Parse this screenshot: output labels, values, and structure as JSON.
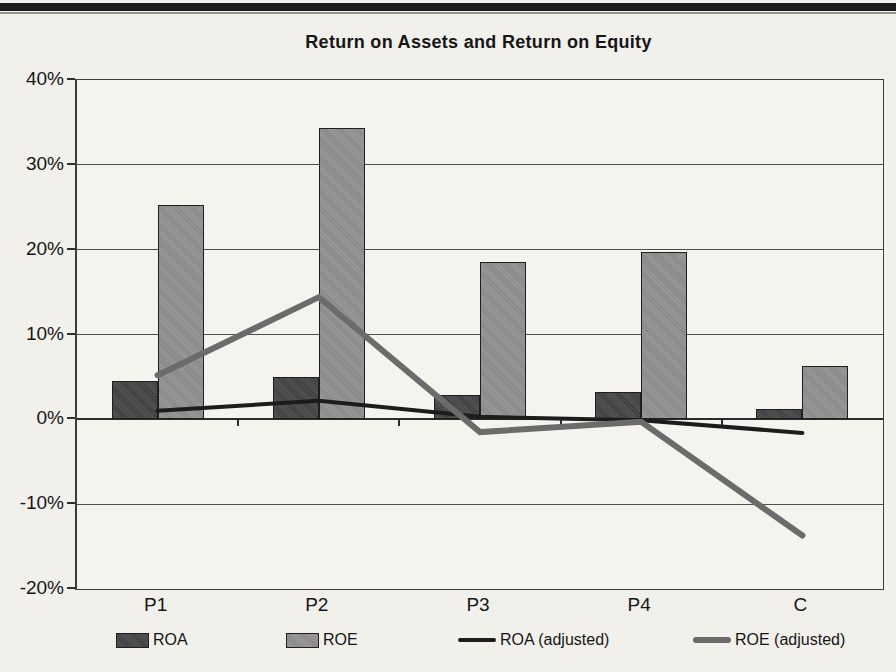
{
  "chart_data": {
    "type": "combo-bar-line",
    "title": "Return on Assets and Return on Equity",
    "categories": [
      "P1",
      "P2",
      "P3",
      "P4",
      "C"
    ],
    "series": [
      {
        "name": "ROA",
        "type": "bar",
        "color": "#424244",
        "values": [
          4.5,
          5.0,
          2.9,
          3.2,
          1.2
        ]
      },
      {
        "name": "ROE",
        "type": "bar",
        "color": "#8f8f91",
        "values": [
          25.3,
          34.4,
          18.5,
          19.7,
          6.3
        ]
      },
      {
        "name": "ROA (adjusted)",
        "type": "line",
        "color": "#1c1c1c",
        "stroke_width": 4,
        "values": [
          1.0,
          2.2,
          0.3,
          -0.1,
          -1.6
        ]
      },
      {
        "name": "ROE (adjusted)",
        "type": "line",
        "color": "#6b6b6b",
        "stroke_width": 6,
        "values": [
          5.2,
          14.4,
          -1.5,
          -0.3,
          -13.7
        ]
      }
    ],
    "y_axis": {
      "min": -20,
      "max": 40,
      "step": 10,
      "suffix": "%",
      "tick_labels": [
        "40%",
        "30%",
        "20%",
        "10%",
        "0%",
        "-10%",
        "-20%"
      ]
    },
    "xlabel": "",
    "ylabel": "",
    "grid": true,
    "legend_position": "bottom"
  }
}
